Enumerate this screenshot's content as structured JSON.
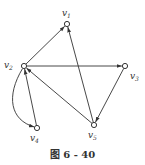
{
  "caption": "图 6 - 40",
  "nodes": [
    {
      "id": "v1",
      "label": "v",
      "sub": "1",
      "x": 67,
      "y": 24,
      "lx": 62,
      "ly": 16
    },
    {
      "id": "v2",
      "label": "v",
      "sub": "2",
      "x": 24,
      "y": 66,
      "lx": 4,
      "ly": 68
    },
    {
      "id": "v3",
      "label": "v",
      "sub": "3",
      "x": 125,
      "y": 66,
      "lx": 130,
      "ly": 79
    },
    {
      "id": "v4",
      "label": "v",
      "sub": "4",
      "x": 37,
      "y": 128,
      "lx": 30,
      "ly": 141
    },
    {
      "id": "v5",
      "label": "v",
      "sub": "5",
      "x": 94,
      "y": 125,
      "lx": 88,
      "ly": 138
    }
  ],
  "edges": [
    {
      "from": "v2",
      "to": "v1",
      "curved": false
    },
    {
      "from": "v2",
      "to": "v3",
      "curved": false
    },
    {
      "from": "v3",
      "to": "v5",
      "curved": false
    },
    {
      "from": "v5",
      "to": "v1",
      "curved": false
    },
    {
      "from": "v5",
      "to": "v2",
      "curved": false
    },
    {
      "from": "v4",
      "to": "v2",
      "curved": false
    },
    {
      "from": "v2",
      "to": "v4",
      "curved": true
    }
  ],
  "colors": {
    "stroke": "#333333",
    "node_fill": "#ffffff"
  }
}
